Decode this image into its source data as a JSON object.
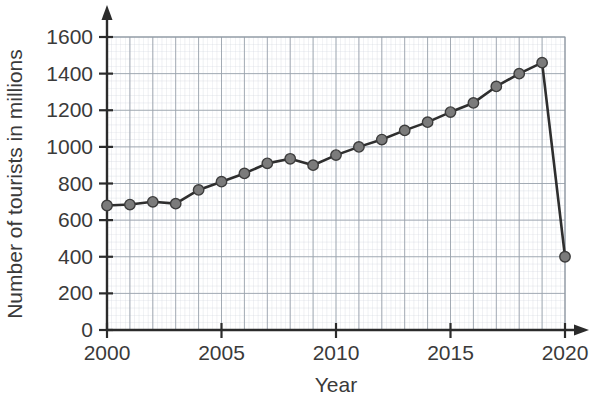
{
  "chart_data": {
    "type": "line",
    "title": "",
    "xlabel": "Year",
    "ylabel": "Number of tourists in millions",
    "xlim": [
      2000,
      2020
    ],
    "ylim": [
      0,
      1600
    ],
    "grid": true,
    "legend": "none",
    "x_tick_labels": [
      "2000",
      "2005",
      "2010",
      "2015",
      "2020"
    ],
    "x_tick_values": [
      2000,
      2005,
      2010,
      2015,
      2020
    ],
    "y_tick_labels": [
      "0",
      "200",
      "400",
      "600",
      "800",
      "1000",
      "1200",
      "1400",
      "1600"
    ],
    "y_tick_values": [
      0,
      200,
      400,
      600,
      800,
      1000,
      1200,
      1400,
      1600
    ],
    "x": [
      2000,
      2001,
      2002,
      2003,
      2004,
      2005,
      2006,
      2007,
      2008,
      2009,
      2010,
      2011,
      2012,
      2013,
      2014,
      2015,
      2016,
      2017,
      2018,
      2019,
      2020
    ],
    "values": [
      680,
      685,
      700,
      690,
      765,
      810,
      855,
      910,
      935,
      900,
      955,
      1000,
      1040,
      1090,
      1135,
      1190,
      1240,
      1330,
      1400,
      1460,
      400
    ],
    "series": [
      {
        "name": "Number of tourists in millions",
        "marker": "circle",
        "marker_color": "#7b7b7b",
        "line_color": "#2e2e2e",
        "values": [
          680,
          685,
          700,
          690,
          765,
          810,
          855,
          910,
          935,
          900,
          955,
          1000,
          1040,
          1090,
          1135,
          1190,
          1240,
          1330,
          1400,
          1460,
          400
        ]
      }
    ],
    "annotations": []
  },
  "colors": {
    "background": "#ffffff",
    "axis": "#2b2b2b",
    "grid_major": "#9aa3ad",
    "grid_minor": "#cfd5dd",
    "line": "#2e2e2e",
    "marker_fill": "#7b7b7b",
    "text": "#3a3a3a"
  }
}
